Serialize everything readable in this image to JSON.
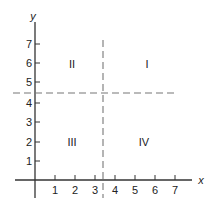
{
  "diagram": {
    "type": "coordinate-plane-quadrants",
    "axes": {
      "x_label": "x",
      "y_label": "y",
      "x_ticks": [
        "1",
        "2",
        "3",
        "4",
        "5",
        "6",
        "7"
      ],
      "y_ticks": [
        "1",
        "2",
        "3",
        "4",
        "5",
        "6",
        "7"
      ]
    },
    "dividers": {
      "vertical_x": 3.4,
      "horizontal_y": 4.5,
      "style": "dashed"
    },
    "quadrants": [
      {
        "label": "I",
        "x": 6,
        "y": 6
      },
      {
        "label": "II",
        "x": 2,
        "y": 6
      },
      {
        "label": "III",
        "x": 2,
        "y": 2
      },
      {
        "label": "IV",
        "x": 5.5,
        "y": 2
      }
    ],
    "colors": {
      "axis": "#333333",
      "dashed": "#777777",
      "text": "#222222"
    }
  }
}
